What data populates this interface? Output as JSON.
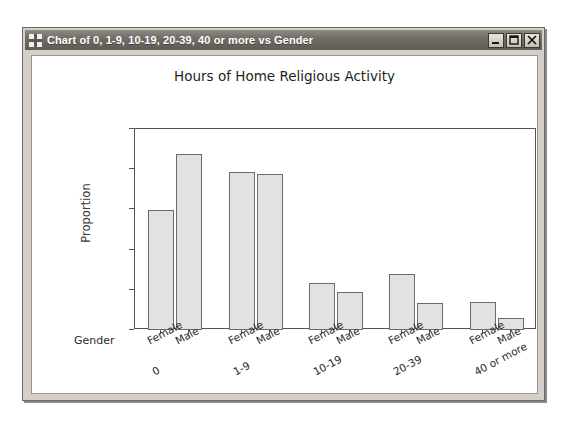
{
  "window": {
    "title": "Chart of 0, 1-9, 10-19, 20-39, 40 or more vs Gender",
    "icon": "move-crosshair-icon",
    "minimize_label": "Minimize",
    "maximize_label": "Maximize",
    "close_label": "Close"
  },
  "chart_data": {
    "type": "bar",
    "title": "Hours of Home Religious Activity",
    "xlabel": "Gender",
    "ylabel": "Proportion",
    "ylim": [
      0.0,
      0.5
    ],
    "yticks": [
      "0.0",
      "0.1",
      "0.2",
      "0.3",
      "0.4",
      "0.5"
    ],
    "ytick_values": [
      0.0,
      0.1,
      0.2,
      0.3,
      0.4,
      0.5
    ],
    "grid": false,
    "legend": "none",
    "categories": [
      "0",
      "1-9",
      "10-19",
      "20-39",
      "40 or more"
    ],
    "subcategories": [
      "Female",
      "Male"
    ],
    "series": [
      {
        "name": "Female",
        "values": [
          0.299,
          0.392,
          0.118,
          0.14,
          0.07
        ]
      },
      {
        "name": "Male",
        "values": [
          0.437,
          0.387,
          0.095,
          0.068,
          0.03
        ]
      }
    ],
    "bars": [
      {
        "group": "0",
        "gender": "Female",
        "value": 0.299
      },
      {
        "group": "0",
        "gender": "Male",
        "value": 0.437
      },
      {
        "group": "1-9",
        "gender": "Female",
        "value": 0.392
      },
      {
        "group": "1-9",
        "gender": "Male",
        "value": 0.387
      },
      {
        "group": "10-19",
        "gender": "Female",
        "value": 0.118
      },
      {
        "group": "10-19",
        "gender": "Male",
        "value": 0.095
      },
      {
        "group": "20-39",
        "gender": "Female",
        "value": 0.14
      },
      {
        "group": "20-39",
        "gender": "Male",
        "value": 0.068
      },
      {
        "group": "40 or more",
        "gender": "Female",
        "value": 0.07
      },
      {
        "group": "40 or more",
        "gender": "Male",
        "value": 0.03
      }
    ],
    "colors": {
      "bar_fill": "#e2e2e2",
      "bar_edge": "#6b6b6b",
      "axis": "#58534e",
      "text": "#2e2b28"
    }
  }
}
